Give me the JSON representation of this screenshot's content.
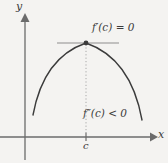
{
  "figure": {
    "background_color": "#f4f3f1",
    "ink_color": "#3b3b3b",
    "axis_color": "#6b6b6b",
    "width": 168,
    "height": 163
  },
  "axes": {
    "x_label": "x",
    "y_label": "y",
    "x_axis_y_px": 137,
    "y_axis_x_px": 25,
    "x_axis_start_px": 0,
    "x_axis_end_px": 157,
    "y_axis_top_px": 14,
    "y_axis_bottom_px": 160,
    "grid": false
  },
  "tick": {
    "label": "c",
    "x_px": 86,
    "value_meaning": "critical number c on the x-axis"
  },
  "curve": {
    "shape": "parabola",
    "concavity": "down",
    "vertex_px": [
      86,
      43
    ],
    "left_end_px": [
      33,
      115
    ],
    "right_end_px": [
      142,
      120
    ],
    "stroke_width": 1.4
  },
  "tangent": {
    "orientation": "horizontal",
    "y_px": 43,
    "x_start_px": 57,
    "x_end_px": 119,
    "color": "#8d8d8d"
  },
  "vertex_point": {
    "x_px": 86,
    "y_px": 43,
    "radius_px": 2.4,
    "color": "#3b3b3b"
  },
  "dashed_drop_line": {
    "x_px": 86,
    "y_top_px": 43,
    "y_bottom_px": 137,
    "style": "dotted",
    "color": "#a8a8a8"
  },
  "annotations": {
    "first_derivative": {
      "function": "f",
      "prime": "′",
      "argument": "(c)",
      "relation": " = 0",
      "full_text": "f′(c) = 0"
    },
    "second_derivative": {
      "function": "f",
      "prime": "″",
      "argument": "(c)",
      "relation": " < 0",
      "full_text": "f″(c) < 0"
    }
  }
}
